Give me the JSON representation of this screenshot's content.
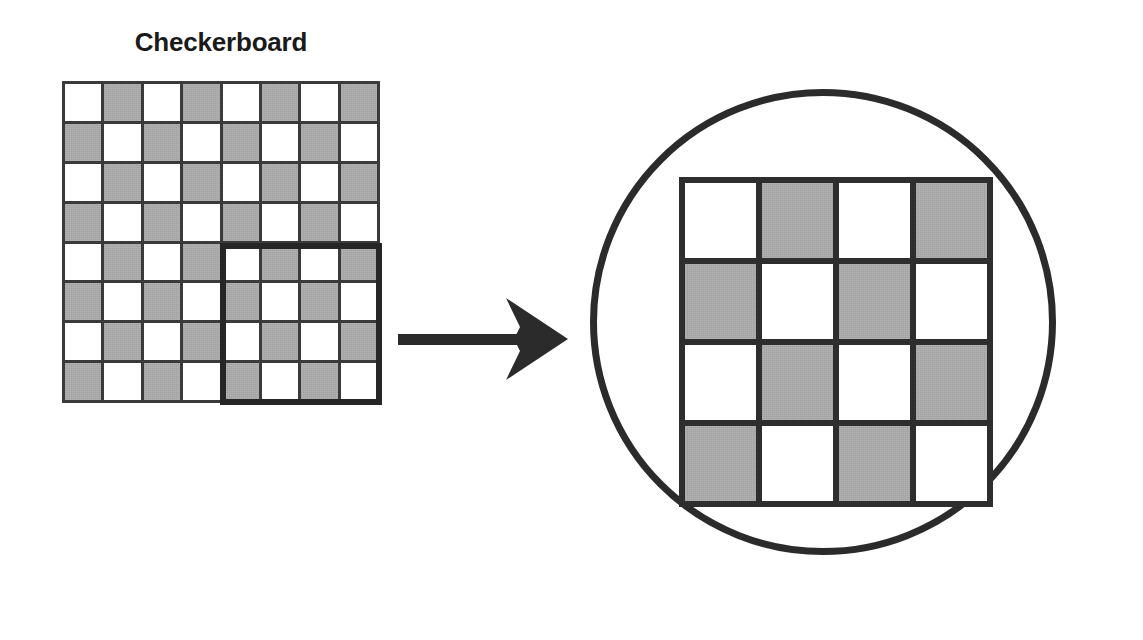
{
  "figure": {
    "title": "Checkerboard",
    "colors": {
      "light_square": "#ffffff",
      "dark_square": "#a9a9a9",
      "grid_line": "#3a3a3a",
      "highlight_outline": "#262626",
      "arrow": "#2b2b2b",
      "circle_outline": "#2b2b2b",
      "text": "#1a1a1a",
      "background": "#ffffff"
    }
  },
  "source_board": {
    "label": "Checkerboard",
    "rows": 8,
    "cols": 8,
    "pattern_note": "light at top-left, strict alternation",
    "cells": [
      [
        "light",
        "dark",
        "light",
        "dark",
        "light",
        "dark",
        "light",
        "dark"
      ],
      [
        "dark",
        "light",
        "dark",
        "light",
        "dark",
        "light",
        "dark",
        "light"
      ],
      [
        "light",
        "dark",
        "light",
        "dark",
        "light",
        "dark",
        "light",
        "dark"
      ],
      [
        "dark",
        "light",
        "dark",
        "light",
        "dark",
        "light",
        "dark",
        "light"
      ],
      [
        "light",
        "dark",
        "light",
        "dark",
        "light",
        "dark",
        "light",
        "dark"
      ],
      [
        "dark",
        "light",
        "dark",
        "light",
        "dark",
        "light",
        "dark",
        "light"
      ],
      [
        "light",
        "dark",
        "light",
        "dark",
        "light",
        "dark",
        "light",
        "dark"
      ],
      [
        "dark",
        "light",
        "dark",
        "light",
        "dark",
        "light",
        "dark",
        "light"
      ]
    ]
  },
  "highlight": {
    "name": "selected-region",
    "row_start": 5,
    "row_end": 8,
    "col_start": 5,
    "col_end": 8,
    "rows": 4,
    "cols": 4
  },
  "arrow": {
    "name": "transform-arrow",
    "direction": "right"
  },
  "magnifier": {
    "name": "magnified-view",
    "shape": "circle",
    "board": {
      "rows": 4,
      "cols": 4,
      "cells": [
        [
          "light",
          "dark",
          "light",
          "dark"
        ],
        [
          "dark",
          "light",
          "dark",
          "light"
        ],
        [
          "light",
          "dark",
          "light",
          "dark"
        ],
        [
          "dark",
          "light",
          "dark",
          "light"
        ]
      ]
    }
  }
}
